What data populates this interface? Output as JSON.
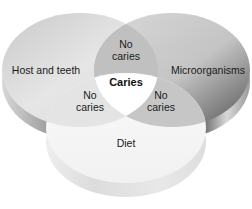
{
  "diagram": {
    "type": "venn-3-set",
    "sets": [
      {
        "id": "host",
        "label": "Host and teeth"
      },
      {
        "id": "micro",
        "label": "Microorganisms"
      },
      {
        "id": "diet",
        "label": "Diet"
      }
    ],
    "intersections": {
      "host_micro": {
        "line1": "No",
        "line2": "caries"
      },
      "host_diet": {
        "line1": "No",
        "line2": "caries"
      },
      "micro_diet": {
        "line1": "No",
        "line2": "caries"
      },
      "all_three": "Caries"
    }
  },
  "colors": {
    "host_top": "#dcdcdc",
    "host_side": "#a9a9a9",
    "micro_top": "#bdbdbd",
    "micro_side": "#3a3a3a",
    "diet_top": "#f7f7f7",
    "diet_side": "#e4e4e4",
    "pair_overlap": "#bfbfbf",
    "center": "#ffffff"
  }
}
